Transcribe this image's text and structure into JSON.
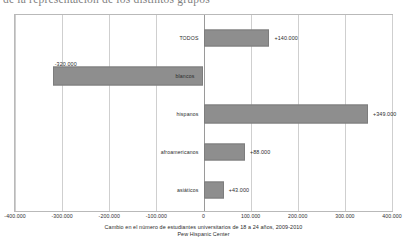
{
  "page": {
    "cut_off_heading": "de la representación de los distintos grupos"
  },
  "caption": {
    "line1": "Cambio en el número de estudiantes universitarios de 18 a 24 años, 2009-2010",
    "line2": "Pew Hispanic Center"
  },
  "colors": {
    "bar_fill": "#8e8e8e",
    "bar_stroke": "#7d7d7d",
    "gridline": "#cfcfcf",
    "zero_line": "#9a9a9a",
    "frame": "#b9b9b9",
    "text": "#2b2b2b"
  },
  "chart_data": {
    "type": "bar",
    "orientation": "horizontal",
    "title": "",
    "subtitle": "",
    "xlabel": "",
    "ylabel": "",
    "categories": [
      "TODOS",
      "blancos",
      "hispanos",
      "afroamericanos",
      "asiáticos"
    ],
    "values": [
      140000,
      -320000,
      349000,
      88000,
      43000
    ],
    "data_labels": [
      "+140.000",
      "-320.000",
      "+349.000",
      "+88.000",
      "+43.000"
    ],
    "xlim": [
      -400000,
      400000
    ],
    "xticks": [
      -400000,
      -300000,
      -200000,
      -100000,
      0,
      100000,
      200000,
      300000,
      400000
    ],
    "xtick_labels": [
      "-400.000",
      "-300.000",
      "-200.000",
      "-100.000",
      "0",
      "100.000",
      "200.000",
      "300.000",
      "400.000"
    ],
    "grid": true,
    "legend": false,
    "series": [
      {
        "name": "Cambio 2009-2010",
        "values": [
          140000,
          -320000,
          349000,
          88000,
          43000
        ]
      }
    ]
  }
}
